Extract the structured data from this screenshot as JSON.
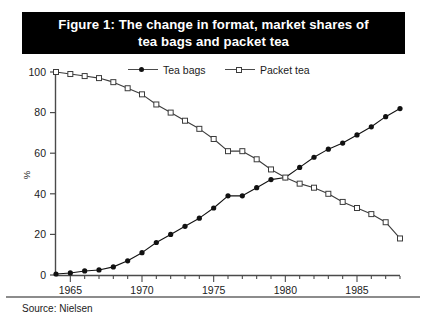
{
  "figure": {
    "title": "Figure 1: The change in format, market shares of\ntea bags and packet tea",
    "source": "Source: Nielsen",
    "title_bg": "#000000",
    "title_fg": "#ffffff"
  },
  "legend": {
    "entries": [
      {
        "label": "Tea bags",
        "marker": "filled-circle",
        "color": "#111111"
      },
      {
        "label": "Packet tea",
        "marker": "open-square",
        "color": "#3c3c3c"
      }
    ]
  },
  "axes": {
    "ylabel": "%",
    "yticks": [
      "0",
      "20",
      "40",
      "60",
      "80",
      "100"
    ],
    "xticks_labeled": [
      "1965",
      "1970",
      "1975",
      "1980",
      "1985"
    ]
  },
  "chart_data": {
    "type": "line",
    "title": "Figure 1: The change in format, market shares of tea bags and packet tea",
    "xlabel": "",
    "ylabel": "%",
    "xlim": [
      1964,
      1988
    ],
    "ylim": [
      0,
      100
    ],
    "grid": false,
    "legend_position": "top-center",
    "x": [
      1964,
      1965,
      1966,
      1967,
      1968,
      1969,
      1970,
      1971,
      1972,
      1973,
      1974,
      1975,
      1976,
      1977,
      1978,
      1979,
      1980,
      1981,
      1982,
      1983,
      1984,
      1985,
      1986,
      1987,
      1988
    ],
    "xtick_labels": [
      "1965",
      "1970",
      "1975",
      "1980",
      "1985"
    ],
    "xtick_values": [
      1965,
      1970,
      1975,
      1980,
      1985
    ],
    "ytick_values": [
      0,
      20,
      40,
      60,
      80,
      100
    ],
    "series": [
      {
        "name": "Tea bags",
        "marker": "filled-circle",
        "color": "#111111",
        "values": [
          0.5,
          1,
          2,
          2.5,
          4,
          7,
          11,
          16,
          20,
          24,
          28,
          33,
          39,
          39,
          43,
          47,
          48,
          53,
          58,
          62,
          65,
          69,
          73,
          78,
          82
        ]
      },
      {
        "name": "Packet tea",
        "marker": "open-square",
        "color": "#3c3c3c",
        "values": [
          100,
          99,
          98,
          97,
          95,
          92,
          89,
          84,
          80,
          76,
          72,
          67,
          61,
          61,
          57,
          52,
          48,
          45,
          43,
          40,
          36,
          33,
          30,
          26,
          18
        ]
      }
    ],
    "annotations": {
      "crossover_year": 1980,
      "crossover_value": 48
    }
  }
}
